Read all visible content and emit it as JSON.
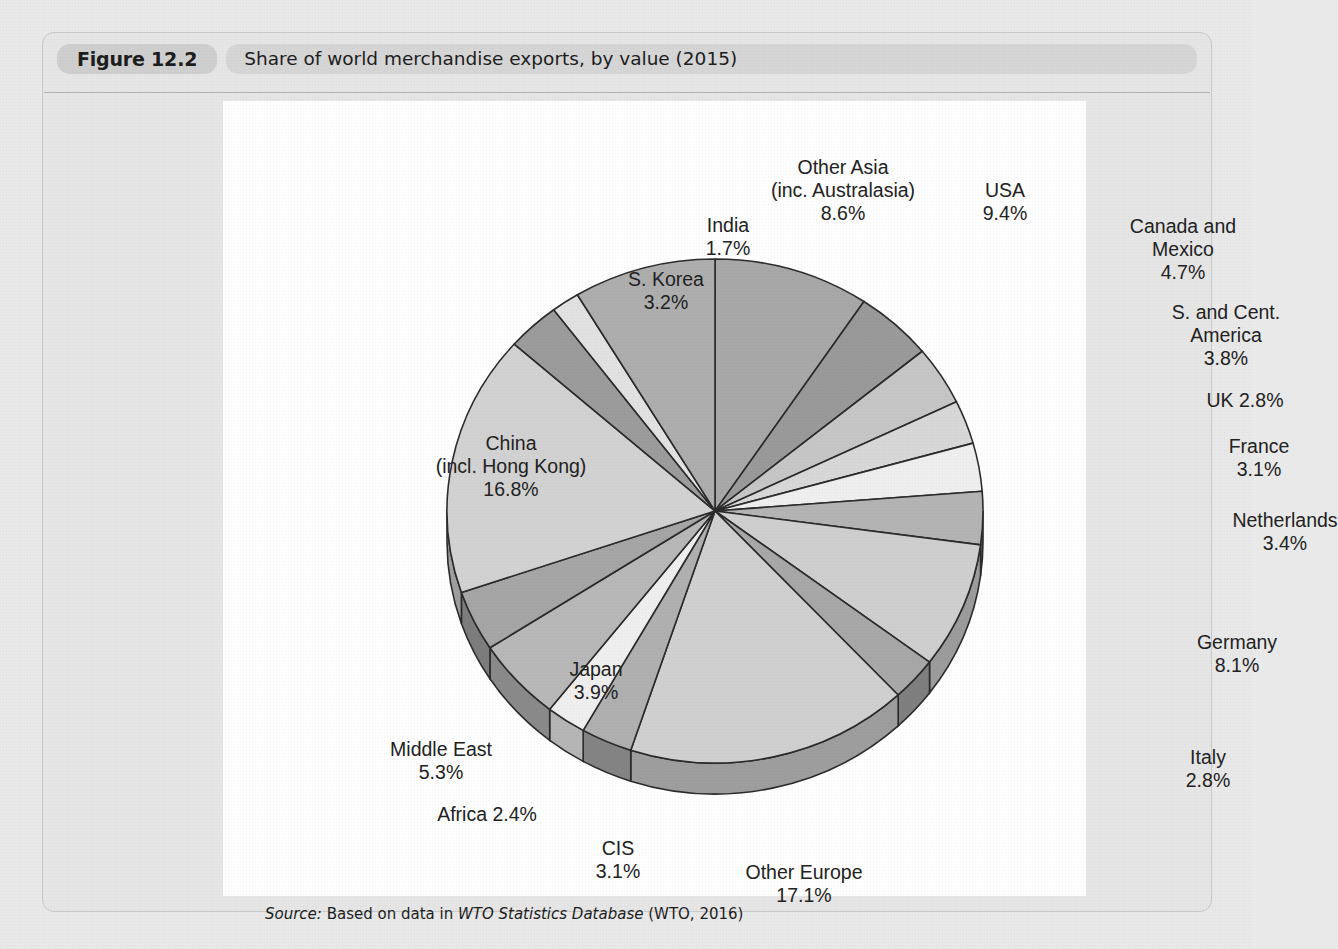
{
  "figure": {
    "number": "Figure 12.2",
    "title": "Share of world merchandise exports, by value (2015)",
    "source_keyword": "Source:",
    "source_text_before": " Based on data in ",
    "source_italic": "WTO Statistics Database",
    "source_text_after": " (WTO, 2016)"
  },
  "chart_data": {
    "type": "pie",
    "title": "Share of world merchandise exports, by value (2015)",
    "unit": "%",
    "legend": "none",
    "labels_position": "outside",
    "start_angle_deg": 0,
    "direction": "clockwise",
    "three_d": true,
    "categories": [
      "USA",
      "Canada and Mexico",
      "S. and Cent. America",
      "UK",
      "France",
      "Netherlands",
      "Germany",
      "Italy",
      "Other Europe",
      "CIS",
      "Africa",
      "Middle East",
      "Japan",
      "China (incl. Hong Kong)",
      "S. Korea",
      "India",
      "Other Asia (inc. Australasia)"
    ],
    "values": [
      9.4,
      4.7,
      3.8,
      2.8,
      3.1,
      3.4,
      8.1,
      2.8,
      17.1,
      3.1,
      2.4,
      5.3,
      3.9,
      16.8,
      3.2,
      1.7,
      8.6
    ],
    "slice_colors": [
      "#a8a8a8",
      "#9a9a9a",
      "#c6c6c6",
      "#d8d8d8",
      "#efefef",
      "#b4b4b4",
      "#cfcfcf",
      "#a8a8a8",
      "#d0d0d0",
      "#b0b0b0",
      "#efefef",
      "#b8b8b8",
      "#a6a6a6",
      "#d2d2d2",
      "#9c9c9c",
      "#e2e2e2",
      "#aeaeae"
    ],
    "side_colors": [
      "#7f7f7f",
      "#737373",
      "#969696",
      "#a4a4a4",
      "#b6b6b6",
      "#868686",
      "#9c9c9c",
      "#7f7f7f",
      "#9e9e9e",
      "#848484",
      "#b6b6b6",
      "#8a8a8a",
      "#7d7d7d",
      "#9f9f9f",
      "#757575",
      "#aaaaaa",
      "#828282"
    ]
  },
  "labels": [
    {
      "name": "other-asia",
      "lines": [
        "Other Asia",
        "(inc. Australasia)",
        "8.6%"
      ],
      "x": 620,
      "y": 55,
      "align": "center"
    },
    {
      "name": "usa",
      "lines": [
        "USA",
        "9.4%"
      ],
      "x": 782,
      "y": 78,
      "align": "center"
    },
    {
      "name": "india",
      "lines": [
        "India",
        "1.7%"
      ],
      "x": 505,
      "y": 113,
      "align": "center"
    },
    {
      "name": "canada-mexico",
      "lines": [
        "Canada and",
        "Mexico",
        "4.7%"
      ],
      "x": 960,
      "y": 114,
      "align": "center"
    },
    {
      "name": "s-korea",
      "lines": [
        "S. Korea",
        "3.2%"
      ],
      "x": 443,
      "y": 167,
      "align": "center"
    },
    {
      "name": "s-cent-america",
      "lines": [
        "S. and Cent.",
        "America",
        "3.8%"
      ],
      "x": 1003,
      "y": 200,
      "align": "center"
    },
    {
      "name": "uk",
      "lines": [
        "UK 2.8%"
      ],
      "x": 1022,
      "y": 288,
      "align": "center"
    },
    {
      "name": "france",
      "lines": [
        "France",
        "3.1%"
      ],
      "x": 1036,
      "y": 334,
      "align": "center"
    },
    {
      "name": "china",
      "lines": [
        "China",
        "(incl. Hong Kong)",
        "16.8%"
      ],
      "x": 288,
      "y": 331,
      "align": "center"
    },
    {
      "name": "netherlands",
      "lines": [
        "Netherlands",
        "3.4%"
      ],
      "x": 1062,
      "y": 408,
      "align": "center"
    },
    {
      "name": "germany",
      "lines": [
        "Germany",
        "8.1%"
      ],
      "x": 1014,
      "y": 530,
      "align": "center"
    },
    {
      "name": "japan",
      "lines": [
        "Japan",
        "3.9%"
      ],
      "x": 373,
      "y": 557,
      "align": "center"
    },
    {
      "name": "middle-east",
      "lines": [
        "Middle East",
        "5.3%"
      ],
      "x": 218,
      "y": 637,
      "align": "center"
    },
    {
      "name": "italy",
      "lines": [
        "Italy",
        "2.8%"
      ],
      "x": 985,
      "y": 645,
      "align": "center"
    },
    {
      "name": "africa",
      "lines": [
        "Africa 2.4%"
      ],
      "x": 264,
      "y": 702,
      "align": "center"
    },
    {
      "name": "cis",
      "lines": [
        "CIS",
        "3.1%"
      ],
      "x": 395,
      "y": 736,
      "align": "center"
    },
    {
      "name": "other-europe",
      "lines": [
        "Other Europe",
        "17.1%"
      ],
      "x": 581,
      "y": 760,
      "align": "center"
    }
  ]
}
